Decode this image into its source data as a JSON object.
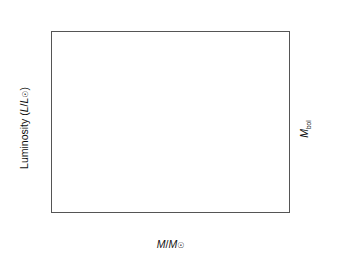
{
  "chart_data": {
    "type": "scatter",
    "title": "",
    "xlabel": "M/M⊙",
    "ylabel": "Luminosity (L/L⊙)",
    "ylabel_right": "M_bol",
    "xlabel_top": "Spectral class",
    "x_scale": "log-reversed",
    "y_scale": "log",
    "xlim": [
      30,
      0.07
    ],
    "ylim": [
      0.0001,
      4000000.0
    ],
    "grid": false,
    "legend": null,
    "x_ticks": [
      "20",
      "10",
      "5",
      "2",
      "1",
      "0.5",
      "0.2",
      "0.1"
    ],
    "x_tick_values": [
      20,
      10,
      5,
      2,
      1,
      0.5,
      0.2,
      0.1
    ],
    "y_ticks": [
      "10⁶",
      "10⁴",
      "10²",
      "1",
      "10⁻²"
    ],
    "y_tick_values": [
      1000000,
      10000,
      100,
      1,
      0.01
    ],
    "y_right_ticks": [
      "−10",
      "−5",
      "0",
      "5",
      "10"
    ],
    "y_right_tick_values": [
      -10,
      -5,
      0,
      5,
      10
    ],
    "top_axis_ticks": [
      "O7",
      "B0",
      "B2",
      "B5",
      "A0",
      "F0",
      "G0",
      "K0",
      "M0",
      "M4",
      "M8"
    ],
    "annotations": [
      {
        "text": "Giants",
        "x": 2.0,
        "y": 600
      },
      {
        "text": "White dwarf",
        "x": 1.9,
        "y": 0.0013
      }
    ],
    "series": [
      {
        "name": "Main sequence stars",
        "color": "#111111",
        "points": [
          [
            27.5,
            150000.0
          ],
          [
            24.0,
            145000.0
          ],
          [
            22.0,
            100000.0
          ],
          [
            20.5,
            95000.0
          ],
          [
            19.5,
            20000.0
          ],
          [
            18.5,
            60000.0
          ],
          [
            18.0,
            55000.0
          ],
          [
            17.5,
            48000.0
          ],
          [
            17.0,
            40000.0
          ],
          [
            16.0,
            42000.0
          ],
          [
            14.5,
            14000.0
          ],
          [
            13.5,
            13000.0
          ],
          [
            13.2,
            14000.0
          ],
          [
            13.0,
            10000.0
          ],
          [
            12.8,
            12000.0
          ],
          [
            12.6,
            11000.0
          ],
          [
            12.4,
            9000.0
          ],
          [
            12.0,
            8500.0
          ],
          [
            11.5,
            2500.0
          ],
          [
            10.5,
            80000.0
          ],
          [
            10.0,
            4000.0
          ],
          [
            9.5,
            3500.0
          ],
          [
            9.0,
            2200.0
          ],
          [
            8.6,
            1200.0
          ],
          [
            8.2,
            1000.0
          ],
          [
            7.6,
            1400.0
          ],
          [
            7.2,
            900.0
          ],
          [
            6.8,
            700.0
          ],
          [
            6.4,
            550.0
          ],
          [
            6.0,
            500.0
          ],
          [
            5.6,
            450.0
          ],
          [
            5.4,
            380.0
          ],
          [
            5.2,
            420.0
          ],
          [
            5.0,
            320.0
          ],
          [
            4.9,
            290.0
          ],
          [
            4.8,
            400.0
          ],
          [
            4.7,
            260.0
          ],
          [
            4.6,
            340.0
          ],
          [
            4.5,
            240.0
          ],
          [
            4.4,
            220.0
          ],
          [
            4.3,
            280.0
          ],
          [
            4.2,
            200.0
          ],
          [
            4.0,
            180.0
          ],
          [
            3.8,
            150.0
          ],
          [
            3.6,
            130.0
          ],
          [
            3.4,
            110.0
          ],
          [
            3.2,
            90.0
          ],
          [
            3.0,
            100.0
          ],
          [
            2.9,
            70.0
          ],
          [
            2.8,
            80.0
          ],
          [
            2.7,
            300.0
          ],
          [
            2.6,
            60.0
          ],
          [
            2.5,
            50.0
          ],
          [
            2.45,
            55.0
          ],
          [
            2.4,
            45.0
          ],
          [
            2.35,
            40.0
          ],
          [
            2.3,
            46.0
          ],
          [
            2.25,
            36.0
          ],
          [
            2.2,
            100.0
          ],
          [
            2.15,
            32.0
          ],
          [
            2.1,
            34.0
          ],
          [
            2.05,
            28.0
          ],
          [
            2.0,
            30.0
          ],
          [
            1.95,
            24.0
          ],
          [
            1.9,
            26.0
          ],
          [
            1.88,
            22.0
          ],
          [
            1.85,
            20.0
          ],
          [
            1.82,
            23.0
          ],
          [
            1.8,
            18.0
          ],
          [
            1.78,
            19.0
          ],
          [
            1.75,
            16.0
          ],
          [
            1.72,
            17.0
          ],
          [
            1.7,
            14.0
          ],
          [
            1.68,
            15.0
          ],
          [
            1.65,
            13.0
          ],
          [
            1.62,
            13.5
          ],
          [
            1.6,
            12.0
          ],
          [
            1.58,
            12.5
          ],
          [
            1.55,
            11.0
          ],
          [
            1.52,
            11.5
          ],
          [
            1.5,
            10.0
          ],
          [
            1.48,
            10.5
          ],
          [
            1.45,
            9.0
          ],
          [
            1.42,
            9.5
          ],
          [
            1.4,
            8.5
          ],
          [
            1.38,
            8.0
          ],
          [
            1.36,
            8.2
          ],
          [
            1.34,
            7.5
          ],
          [
            1.32,
            7.8
          ],
          [
            1.3,
            7.0
          ],
          [
            1.28,
            7.2
          ],
          [
            1.26,
            6.5
          ],
          [
            1.24,
            6.8
          ],
          [
            1.22,
            6.0
          ],
          [
            1.2,
            6.2
          ],
          [
            1.18,
            5.5
          ],
          [
            1.16,
            5.8
          ],
          [
            1.14,
            5.0
          ],
          [
            1.12,
            5.2
          ],
          [
            1.1,
            4.6
          ],
          [
            1.08,
            4.8
          ],
          [
            1.06,
            4.2
          ],
          [
            1.04,
            4.4
          ],
          [
            1.02,
            3.8
          ],
          [
            1.0,
            4.0
          ],
          [
            0.98,
            3.4
          ],
          [
            0.96,
            3.6
          ],
          [
            0.95,
            3.0
          ],
          [
            0.94,
            3.2
          ],
          [
            0.93,
            2.8
          ],
          [
            0.92,
            2.9
          ],
          [
            0.91,
            2.5
          ],
          [
            0.9,
            2.6
          ],
          [
            0.89,
            2.3
          ],
          [
            0.88,
            2.4
          ],
          [
            0.87,
            2.0
          ],
          [
            0.86,
            2.1
          ],
          [
            0.85,
            1.8
          ],
          [
            0.84,
            1.9
          ],
          [
            0.83,
            1.6
          ],
          [
            0.82,
            1.7
          ],
          [
            0.81,
            1.45
          ],
          [
            0.8,
            1.5
          ],
          [
            0.79,
            1.3
          ],
          [
            0.78,
            1.35
          ],
          [
            0.77,
            1.15
          ],
          [
            0.76,
            1.2
          ],
          [
            0.75,
            1.05
          ],
          [
            0.74,
            1.1
          ],
          [
            0.73,
            0.95
          ],
          [
            0.72,
            1.0
          ],
          [
            0.71,
            0.85
          ],
          [
            0.7,
            0.9
          ],
          [
            0.68,
            0.75
          ],
          [
            0.66,
            0.8
          ],
          [
            0.64,
            0.65
          ],
          [
            0.62,
            0.7
          ],
          [
            0.6,
            0.55
          ],
          [
            0.58,
            0.6
          ],
          [
            0.56,
            0.48
          ],
          [
            0.54,
            0.52
          ],
          [
            0.52,
            0.42
          ],
          [
            0.5,
            0.45
          ],
          [
            0.48,
            0.38
          ],
          [
            0.46,
            0.4
          ],
          [
            0.44,
            0.33
          ],
          [
            0.42,
            0.36
          ],
          [
            0.4,
            0.28
          ],
          [
            0.38,
            0.3
          ],
          [
            0.36,
            0.22
          ],
          [
            0.34,
            0.25
          ],
          [
            0.32,
            0.19
          ],
          [
            0.3,
            0.21
          ],
          [
            0.28,
            0.16
          ],
          [
            0.26,
            0.14
          ],
          [
            0.25,
            0.17
          ],
          [
            0.24,
            0.12
          ],
          [
            0.22,
            0.13
          ],
          [
            0.21,
            0.095
          ],
          [
            0.2,
            0.1
          ],
          [
            0.46,
            0.55
          ],
          [
            0.44,
            0.62
          ],
          [
            0.42,
            0.5
          ],
          [
            0.5,
            0.6
          ],
          [
            0.18,
            0.06
          ],
          [
            0.17,
            0.07
          ],
          [
            0.16,
            0.05
          ],
          [
            0.15,
            0.04
          ],
          [
            0.14,
            0.03
          ],
          [
            0.13,
            0.028
          ],
          [
            0.125,
            0.022
          ],
          [
            0.12,
            0.018
          ],
          [
            0.115,
            0.016
          ],
          [
            0.11,
            0.012
          ],
          [
            0.105,
            0.01
          ],
          [
            0.1,
            0.0085
          ],
          [
            0.095,
            0.007
          ],
          [
            0.092,
            0.006
          ],
          [
            0.09,
            0.005
          ],
          [
            0.088,
            0.0048
          ],
          [
            0.085,
            0.004
          ],
          [
            0.082,
            0.003
          ],
          [
            0.08,
            0.0022
          ],
          [
            0.078,
            0.002
          ],
          [
            0.076,
            0.0012
          ],
          [
            0.074,
            0.001
          ],
          [
            0.072,
            0.00065
          ]
        ]
      },
      {
        "name": "Giants",
        "color": "#8a8a8a",
        "marker": "large-circle",
        "points": [
          [
            2.05,
            320
          ],
          [
            1.18,
            330
          ]
        ]
      },
      {
        "name": "White dwarf",
        "color": "#111111",
        "points": [
          [
            1.42,
            0.0013
          ]
        ]
      }
    ]
  }
}
